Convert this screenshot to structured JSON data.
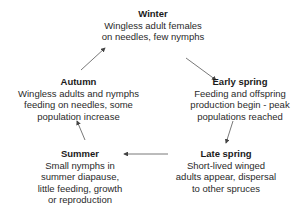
{
  "diagram": {
    "type": "cycle",
    "nodes": [
      {
        "id": "winter",
        "title": "Winter",
        "lines": [
          "Wingless adult females",
          "on needles, few nymphs"
        ]
      },
      {
        "id": "early_spring",
        "title": "Early spring",
        "lines": [
          "Feeding and offspring",
          "production begin - peak",
          "populations reached"
        ]
      },
      {
        "id": "late_spring",
        "title": "Late spring",
        "lines": [
          "Short-lived winged",
          "adults appear, dispersal",
          "to other spruces"
        ]
      },
      {
        "id": "summer",
        "title": "Summer",
        "lines": [
          "Small nymphs in",
          "summer diapause,",
          "little feeding, growth",
          "or reproduction"
        ]
      },
      {
        "id": "autumn",
        "title": "Autumn",
        "lines": [
          "Wingless adults and nymphs",
          "feeding on needles, some",
          "population increase"
        ]
      }
    ],
    "edges": [
      {
        "from": "winter",
        "to": "early_spring"
      },
      {
        "from": "early_spring",
        "to": "late_spring"
      },
      {
        "from": "late_spring",
        "to": "summer"
      },
      {
        "from": "summer",
        "to": "autumn"
      },
      {
        "from": "autumn",
        "to": "winter"
      }
    ],
    "colors": {
      "text": "#2a2a2a",
      "arrow": "#444444",
      "background": "#ffffff"
    }
  }
}
